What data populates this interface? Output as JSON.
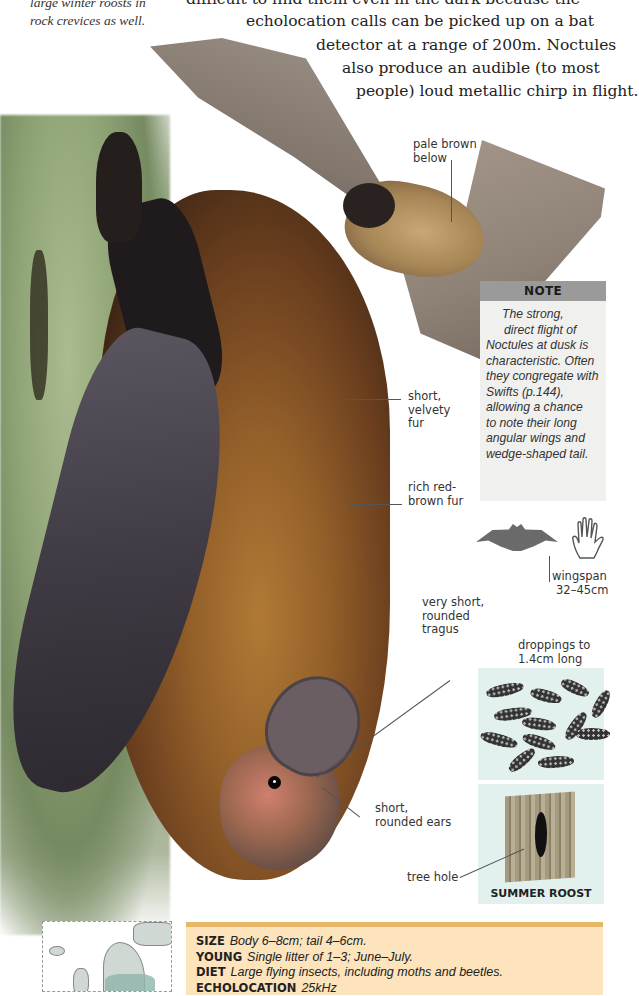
{
  "side_caption": {
    "lines": [
      "large winter roosts in",
      "rock crevices as well."
    ]
  },
  "body_text": {
    "lines": [
      "difficult to find them even in the dark because the",
      "echolocation calls can be picked up on a bat",
      "detector at a range of 200m. Noctules",
      "also produce an audible (to most",
      "people) loud metallic chirp in flight."
    ]
  },
  "labels": {
    "pale_brown": [
      "pale brown",
      "below"
    ],
    "velvety_fur": [
      "short,",
      "velvety",
      "fur"
    ],
    "red_brown_fur": [
      "rich red-",
      "brown fur"
    ],
    "tragus": [
      "very short,",
      "rounded",
      "tragus"
    ],
    "ears": [
      "short,",
      "rounded ears"
    ],
    "wingspan": [
      "wingspan",
      "32–45cm"
    ],
    "droppings": [
      "droppings to",
      "1.4cm long"
    ],
    "tree_hole": "tree hole"
  },
  "note": {
    "title": "NOTE",
    "lines": [
      "The strong,",
      "direct flight of",
      "Noctules at dusk is",
      "characteristic. Often",
      "they congregate with",
      "Swifts (p.144),",
      "allowing a chance",
      "to note their long",
      "angular wings and",
      "wedge-shaped tail."
    ]
  },
  "roost": {
    "caption": "SUMMER ROOST"
  },
  "facts": [
    {
      "key": "SIZE",
      "value": "Body 6–8cm; tail 4–6cm."
    },
    {
      "key": "YOUNG",
      "value": "Single litter of 1–3; June–July."
    },
    {
      "key": "DIET",
      "value": "Large flying insects, including moths and beetles."
    },
    {
      "key": "ECHOLOCATION",
      "value": "25kHz"
    }
  ],
  "colors": {
    "facts_bg": "#fde4bd",
    "facts_border": "#e8b668",
    "note_header": "#9a9a9a",
    "note_bg": "#f0f0ef",
    "panel_bg": "#e3f1ee"
  }
}
